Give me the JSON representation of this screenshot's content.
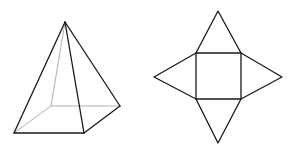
{
  "figure": {
    "colors": {
      "line": "#1a1a1a",
      "hidden_line": "#9a9a9a",
      "background": "#ffffff"
    },
    "pyramid": {
      "apex": [
        65,
        22
      ],
      "base": {
        "front_left": [
          14,
          133
        ],
        "front_right": [
          84,
          133
        ],
        "back_right": [
          120,
          106
        ],
        "back_left": [
          51,
          106
        ]
      }
    },
    "net": {
      "square": {
        "top_left": [
          196,
          53
        ],
        "top_right": [
          241,
          53
        ],
        "bottom_right": [
          241,
          99
        ],
        "bottom_left": [
          196,
          99
        ]
      },
      "triangle_apexes": {
        "top": [
          218,
          11
        ],
        "right": [
          282,
          77
        ],
        "bottom": [
          218,
          143
        ],
        "left": [
          154,
          77
        ]
      }
    }
  }
}
